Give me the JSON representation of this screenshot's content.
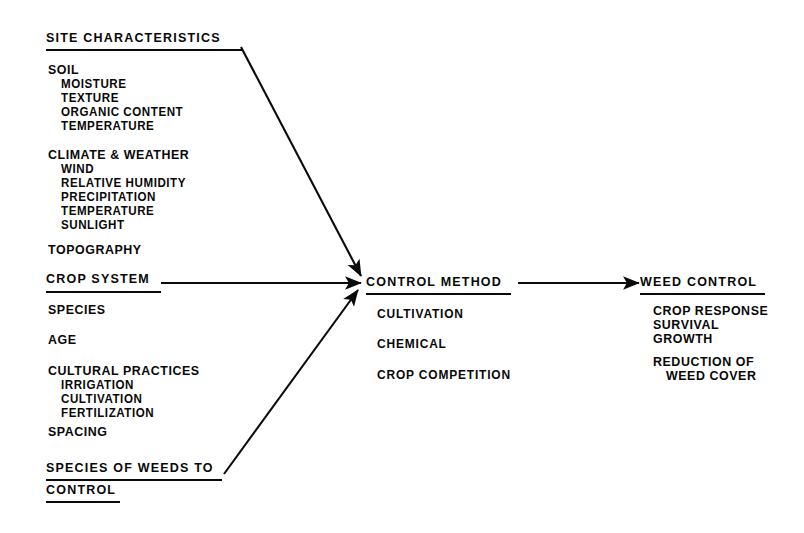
{
  "diagram": {
    "ink_color": "#080808",
    "background_color": "#ffffff",
    "columns": {
      "inputs": {
        "site_characteristics": {
          "heading": "SITE CHARACTERISTICS",
          "groups": [
            {
              "label": "SOIL",
              "items": [
                "MOISTURE",
                "TEXTURE",
                "ORGANIC CONTENT",
                "TEMPERATURE"
              ]
            },
            {
              "label": "CLIMATE & WEATHER",
              "items": [
                "WIND",
                "RELATIVE HUMIDITY",
                "PRECIPITATION",
                "TEMPERATURE",
                "SUNLIGHT"
              ]
            },
            {
              "label": "TOPOGRAPHY",
              "items": []
            }
          ]
        },
        "crop_system": {
          "heading": "CROP SYSTEM",
          "groups": [
            {
              "label": "SPECIES",
              "items": []
            },
            {
              "label": "AGE",
              "items": []
            },
            {
              "label": "CULTURAL PRACTICES",
              "items": [
                "IRRIGATION",
                "CULTIVATION",
                "FERTILIZATION"
              ]
            },
            {
              "label": "SPACING",
              "items": []
            }
          ]
        },
        "species_of_weeds": {
          "heading_line1": "SPECIES OF WEEDS TO",
          "heading_line2": "CONTROL"
        }
      },
      "process": {
        "heading": "CONTROL METHOD",
        "items": [
          "CULTIVATION",
          "CHEMICAL",
          "CROP COMPETITION"
        ]
      },
      "output": {
        "heading": "WEED CONTROL",
        "items": [
          "CROP RESPONSE",
          "SURVIVAL",
          "GROWTH"
        ],
        "items_group2": [
          "REDUCTION OF",
          "WEED COVER"
        ]
      }
    },
    "connections": [
      {
        "name": "site-characteristics-to-control-method",
        "from": "SITE CHARACTERISTICS",
        "to": "CONTROL METHOD"
      },
      {
        "name": "crop-system-to-control-method",
        "from": "CROP SYSTEM",
        "to": "CONTROL METHOD"
      },
      {
        "name": "species-of-weeds-to-control-method",
        "from": "SPECIES OF WEEDS TO CONTROL",
        "to": "CONTROL METHOD"
      },
      {
        "name": "control-method-to-weed-control",
        "from": "CONTROL METHOD",
        "to": "WEED CONTROL"
      }
    ]
  }
}
